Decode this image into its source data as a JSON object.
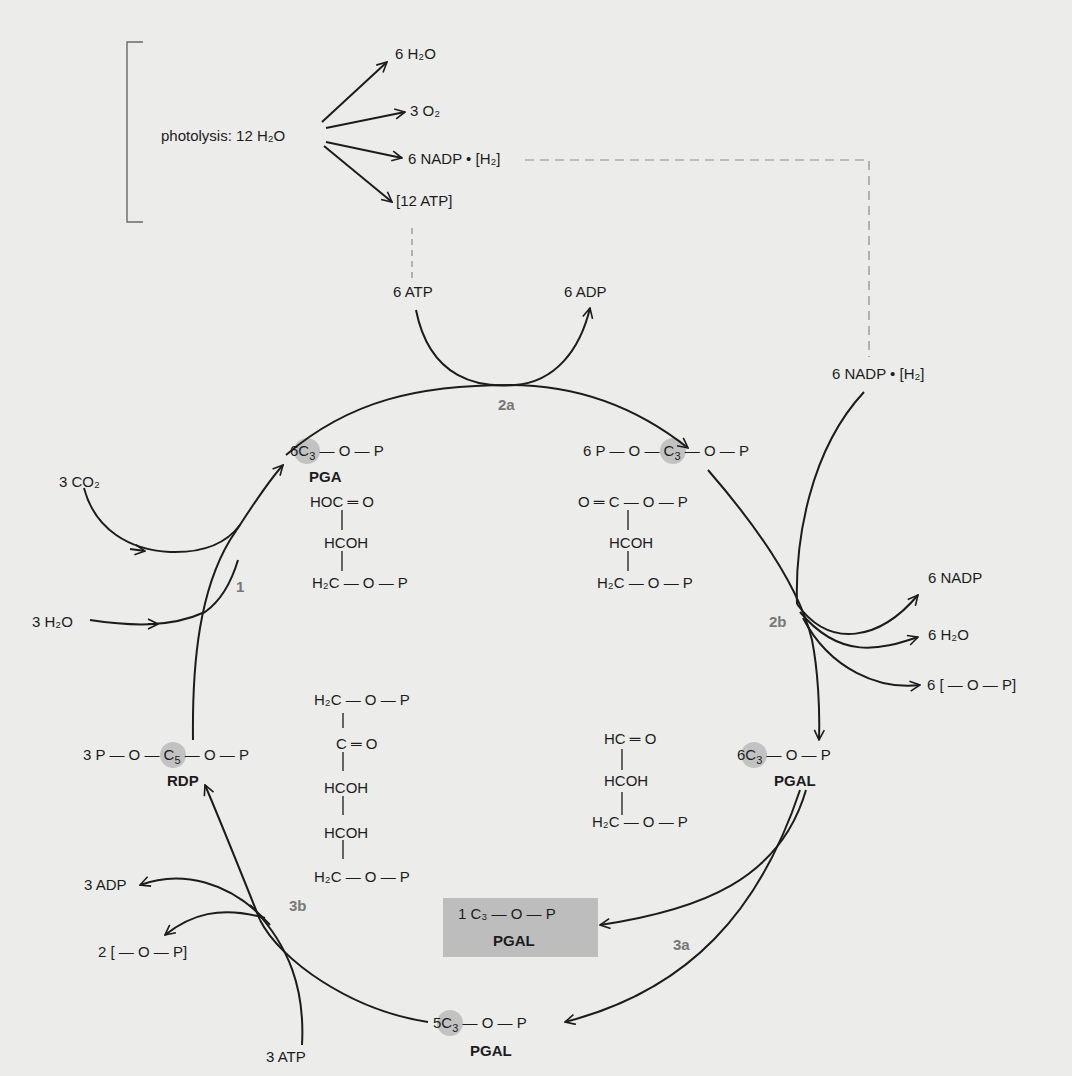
{
  "photolysis": {
    "label": "photolysis:",
    "reactant": "12 H₂O",
    "products": [
      "6 H₂O",
      "3 O₂",
      "6 NADP • [H₂]",
      "[12 ATP]"
    ]
  },
  "energy_inputs": {
    "atp_in": "6 ATP",
    "adp_out": "6 ADP",
    "nadph_in": "6 NADP • [H₂]"
  },
  "steps": {
    "s1": "1",
    "s2a": "2a",
    "s2b": "2b",
    "s3a": "3a",
    "s3b": "3b"
  },
  "inputs_step1": [
    "3 CO₂",
    "3 H₂O"
  ],
  "outputs_step2b": [
    "6 NADP",
    "6 H₂O",
    "6 [ — O — P]"
  ],
  "outputs_step3b": [
    "3 ADP",
    "2 [ — O — P]"
  ],
  "input_step3b": "3 ATP",
  "compounds": {
    "pga": {
      "coef": "6",
      "formula_tail": "— O — P",
      "name": "PGA",
      "structure": [
        "HOC ═ O",
        "HCOH",
        "H₂C — O — P"
      ]
    },
    "diphosphoglycerate": {
      "coef": "6",
      "formula_head": "P — O —",
      "formula_tail": "— O — P",
      "structure": [
        "O ═ C — O — P",
        "HCOH",
        "H₂C — O — P"
      ]
    },
    "pgal6": {
      "coef": "6",
      "formula_tail": "— O — P",
      "name": "PGAL",
      "structure": [
        "HC ═ O",
        "HCOH",
        "H₂C — O — P"
      ]
    },
    "pgal_product": {
      "text": "1 C₃ — O — P",
      "name": "PGAL"
    },
    "pgal5": {
      "coef": "5",
      "formula_tail": "— O — P",
      "name": "PGAL"
    },
    "rdp": {
      "coef": "3",
      "formula_head": "P — O —",
      "formula_tail": "— O — P",
      "name": "RDP",
      "structure": [
        "H₂C — O — P",
        "C ═ O",
        "HCOH",
        "HCOH",
        "H₂C — O — P"
      ]
    }
  },
  "carbons": {
    "c3": "C",
    "c3_sub": "3",
    "c5": "C",
    "c5_sub": "5"
  },
  "colors": {
    "background": "#ececea",
    "line": "#1c1c1c",
    "dashed": "#8a8a8a",
    "carbon_dot": "#c2c2c2",
    "product_box": "#bdbdbd",
    "step_label": "#777777"
  }
}
